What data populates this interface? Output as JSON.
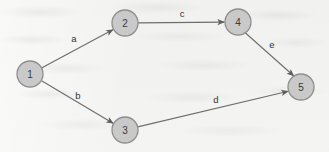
{
  "figure": {
    "kind": "directed-graph",
    "background_color": "#f3f3f1",
    "node_fill_color": "#c9c9c9",
    "node_stroke_color": "#8e8e8e",
    "edge_color": "#6e6e6e",
    "label_color": "#333333"
  },
  "nodes": [
    {
      "id": "1",
      "label": "1",
      "cx": 30,
      "cy": 74,
      "r": 13
    },
    {
      "id": "2",
      "label": "2",
      "cx": 125,
      "cy": 23,
      "r": 13
    },
    {
      "id": "3",
      "label": "3",
      "cx": 125,
      "cy": 130,
      "r": 13
    },
    {
      "id": "4",
      "label": "4",
      "cx": 238,
      "cy": 22,
      "r": 13
    },
    {
      "id": "5",
      "label": "5",
      "cx": 301,
      "cy": 87,
      "r": 13
    }
  ],
  "edges": [
    {
      "id": "a",
      "label": "a",
      "from": "1",
      "to": "2",
      "label_x": 74,
      "label_y": 38,
      "directed": true
    },
    {
      "id": "b",
      "label": "b",
      "from": "1",
      "to": "3",
      "label_x": 78,
      "label_y": 95,
      "directed": true
    },
    {
      "id": "c",
      "label": "c",
      "from": "2",
      "to": "4",
      "label_x": 182,
      "label_y": 13,
      "directed": true
    },
    {
      "id": "d",
      "label": "d",
      "from": "3",
      "to": "5",
      "label_x": 216,
      "label_y": 99,
      "directed": true
    },
    {
      "id": "e",
      "label": "e",
      "from": "4",
      "to": "5",
      "label_x": 272,
      "label_y": 44,
      "directed": true
    }
  ]
}
